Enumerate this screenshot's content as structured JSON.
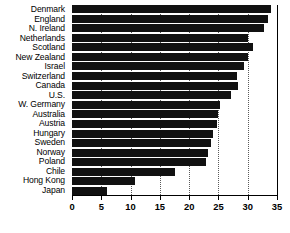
{
  "chart_data": {
    "type": "bar",
    "orientation": "horizontal",
    "title": "",
    "subtitle": "",
    "xlabel": "",
    "ylabel": "",
    "xlim": [
      0,
      35
    ],
    "xticks": [
      0,
      5,
      10,
      15,
      20,
      25,
      30,
      35
    ],
    "xtick_labels": [
      "0",
      "5",
      "10",
      "15",
      "20",
      "25",
      "30",
      "35"
    ],
    "grid": "vertical-dotted",
    "legend": "none",
    "bar_color": "#111111",
    "background_color": "#ffffff",
    "axis_color": "#000000",
    "categories": [
      "Denmark",
      "England",
      "N. Ireland",
      "Netherlands",
      "Scotland",
      "New Zealand",
      "Israel",
      "Switzerland",
      "Canada",
      "U.S.",
      "W. Germany",
      "Australia",
      "Austria",
      "Hungary",
      "Sweden",
      "Norway",
      "Poland",
      "Chile",
      "Hong Kong",
      "Japan"
    ],
    "values": [
      34.0,
      33.5,
      32.8,
      30.0,
      30.9,
      30.0,
      29.4,
      28.2,
      28.3,
      27.2,
      25.2,
      24.9,
      24.8,
      24.0,
      23.7,
      23.2,
      22.8,
      17.5,
      10.7,
      5.9
    ]
  }
}
